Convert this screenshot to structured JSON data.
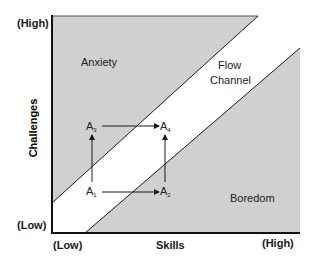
{
  "diagram": {
    "type": "flow-channel",
    "axes": {
      "x": {
        "label": "Skills",
        "low": "(Low)",
        "high": "(High)"
      },
      "y": {
        "label": "Challenges",
        "low": "(Low)",
        "high": "(High)"
      }
    },
    "regions": {
      "anxiety": "Anxiety",
      "flow_line1": "Flow",
      "flow_line2": "Channel",
      "boredom": "Boredom"
    },
    "points": [
      {
        "id": "A1",
        "letter": "A",
        "sub": "1"
      },
      {
        "id": "A2",
        "letter": "A",
        "sub": "2"
      },
      {
        "id": "A3",
        "letter": "A",
        "sub": "3"
      },
      {
        "id": "A4",
        "letter": "A",
        "sub": "4"
      }
    ],
    "transitions": [
      {
        "from": "A1",
        "to": "A2"
      },
      {
        "from": "A1",
        "to": "A3"
      },
      {
        "from": "A3",
        "to": "A4"
      },
      {
        "from": "A2",
        "to": "A4"
      }
    ],
    "colors": {
      "shaded": "#d0d0d0",
      "channel": "#ffffff",
      "line": "#1a1a1a"
    }
  }
}
